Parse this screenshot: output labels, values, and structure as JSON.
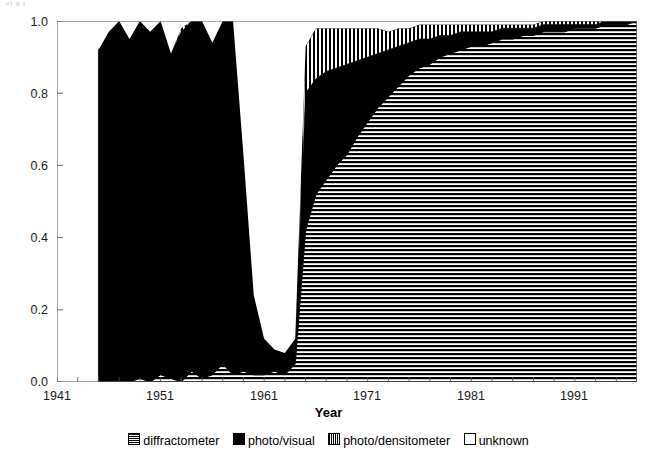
{
  "artifact_text": "u)    g   )",
  "axis": {
    "x_title": "Year",
    "y_title": "",
    "y_ticks": [
      "0.0",
      "0.2",
      "0.4",
      "0.6",
      "0.8",
      "1.0"
    ],
    "x_ticks": [
      "1941",
      "1951",
      "1961",
      "1971",
      "1981",
      "1991"
    ]
  },
  "legend": {
    "items": [
      {
        "label": "diffractometer",
        "pattern": "horizontal-lines",
        "color": "#000000"
      },
      {
        "label": "photo/visual",
        "pattern": "solid",
        "color": "#000000"
      },
      {
        "label": "photo/densitometer",
        "pattern": "vertical-lines",
        "color": "#000000"
      },
      {
        "label": "unknown",
        "pattern": "empty",
        "color": "#ffffff"
      }
    ]
  },
  "chart_data": {
    "type": "area",
    "stacked": true,
    "normalized": true,
    "title": "",
    "xlabel": "Year",
    "ylabel": "",
    "xlim": [
      1941,
      1997
    ],
    "ylim": [
      0.0,
      1.0
    ],
    "grid": false,
    "legend_position": "bottom",
    "x": [
      1945,
      1946,
      1947,
      1948,
      1949,
      1950,
      1951,
      1952,
      1953,
      1954,
      1955,
      1956,
      1957,
      1958,
      1959,
      1960,
      1961,
      1962,
      1963,
      1964,
      1965,
      1966,
      1967,
      1968,
      1969,
      1970,
      1971,
      1972,
      1973,
      1974,
      1975,
      1976,
      1977,
      1978,
      1979,
      1980,
      1981,
      1982,
      1983,
      1984,
      1985,
      1986,
      1987,
      1988,
      1989,
      1990,
      1991,
      1992,
      1993,
      1994,
      1995,
      1996,
      1997
    ],
    "series": [
      {
        "name": "diffractometer",
        "pattern": "horizontal-lines",
        "values": [
          0.0,
          0.0,
          0.0,
          0.0,
          0.01,
          0.0,
          0.02,
          0.01,
          0.0,
          0.03,
          0.01,
          0.02,
          0.05,
          0.02,
          0.03,
          0.02,
          0.02,
          0.03,
          0.02,
          0.05,
          0.42,
          0.52,
          0.56,
          0.6,
          0.63,
          0.68,
          0.72,
          0.76,
          0.79,
          0.82,
          0.85,
          0.87,
          0.88,
          0.9,
          0.91,
          0.92,
          0.93,
          0.93,
          0.94,
          0.95,
          0.95,
          0.96,
          0.96,
          0.97,
          0.97,
          0.97,
          0.98,
          0.98,
          0.98,
          0.99,
          0.99,
          0.99,
          1.0
        ]
      },
      {
        "name": "photo/visual",
        "pattern": "solid",
        "values": [
          0.92,
          0.97,
          1.0,
          0.95,
          0.99,
          0.97,
          0.98,
          0.9,
          0.97,
          0.97,
          0.99,
          0.92,
          0.95,
          0.98,
          0.6,
          0.22,
          0.1,
          0.06,
          0.06,
          0.07,
          0.38,
          0.32,
          0.3,
          0.27,
          0.25,
          0.21,
          0.18,
          0.15,
          0.13,
          0.11,
          0.09,
          0.08,
          0.07,
          0.06,
          0.05,
          0.05,
          0.04,
          0.04,
          0.03,
          0.03,
          0.03,
          0.02,
          0.02,
          0.02,
          0.02,
          0.02,
          0.01,
          0.01,
          0.01,
          0.01,
          0.01,
          0.01,
          0.0
        ]
      },
      {
        "name": "photo/densitometer",
        "pattern": "vertical-lines",
        "values": [
          0.0,
          0.0,
          0.0,
          0.0,
          0.0,
          0.0,
          0.0,
          0.0,
          0.01,
          0.0,
          0.0,
          0.0,
          0.0,
          0.0,
          0.0,
          0.0,
          0.0,
          0.0,
          0.0,
          0.0,
          0.13,
          0.14,
          0.12,
          0.11,
          0.1,
          0.09,
          0.08,
          0.07,
          0.05,
          0.05,
          0.04,
          0.04,
          0.04,
          0.03,
          0.03,
          0.02,
          0.02,
          0.02,
          0.02,
          0.01,
          0.01,
          0.01,
          0.01,
          0.01,
          0.01,
          0.01,
          0.01,
          0.01,
          0.01,
          0.0,
          0.0,
          0.0,
          0.0
        ]
      },
      {
        "name": "unknown",
        "pattern": "empty",
        "values": [
          0.08,
          0.03,
          0.0,
          0.05,
          0.0,
          0.03,
          0.0,
          0.09,
          0.02,
          0.0,
          0.0,
          0.06,
          0.0,
          0.0,
          0.37,
          0.76,
          0.88,
          0.91,
          0.92,
          0.88,
          0.07,
          0.02,
          0.02,
          0.02,
          0.02,
          0.02,
          0.02,
          0.02,
          0.03,
          0.02,
          0.02,
          0.01,
          0.01,
          0.01,
          0.01,
          0.01,
          0.01,
          0.01,
          0.01,
          0.01,
          0.01,
          0.01,
          0.01,
          0.0,
          0.0,
          0.0,
          0.0,
          0.0,
          0.0,
          0.0,
          0.0,
          0.0,
          0.0
        ]
      }
    ]
  }
}
